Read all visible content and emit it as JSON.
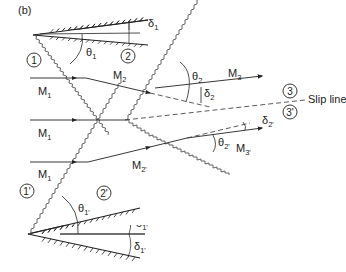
{
  "panel_label": "(b)",
  "regions": {
    "r1": "1",
    "r2": "2",
    "r3": "3",
    "r1p": "1'",
    "r2p": "2'",
    "r3p": "3'"
  },
  "mach_labels": {
    "m1_top": "M",
    "m1_top_sub": "1",
    "m1_mid": "M",
    "m1_mid_sub": "1",
    "m1_bot": "M",
    "m1_bot_sub": "1",
    "m1_low": "M",
    "m1_low_sub": "1",
    "m2": "M",
    "m2_sub": "2",
    "m3": "M",
    "m3_sub": "3",
    "m2p": "M",
    "m2p_sub": "2'",
    "m3p": "M",
    "m3p_sub": "3'"
  },
  "angles": {
    "theta1": "θ",
    "theta1_sub": "1",
    "theta2": "θ",
    "theta2_sub": "2",
    "delta1_a": "δ",
    "delta1_a_sub": "1",
    "delta1_b": "δ",
    "delta1_b_sub": "1",
    "delta2": "δ",
    "delta2_sub": "2",
    "theta1p": "θ",
    "theta1p_sub": "1'",
    "theta2p": "θ",
    "theta2p_sub": "2'",
    "delta1p_a": "δ",
    "delta1p_a_sub": "1'",
    "delta1p_b": "δ",
    "delta1p_b_sub": "1'",
    "delta2p": "δ",
    "delta2p_sub": "2'"
  },
  "slip_line_label": "Slip line"
}
